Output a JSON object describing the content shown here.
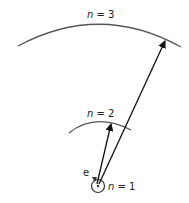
{
  "diagram": {
    "levels": [
      {
        "id": "n1",
        "label_var": "n",
        "label_eq": " = 1"
      },
      {
        "id": "n2",
        "label_var": "n",
        "label_eq": " = 2"
      },
      {
        "id": "n3",
        "label_var": "n",
        "label_eq": " = 3"
      }
    ],
    "electron_label": "e",
    "transitions": [
      {
        "from": "n1",
        "to": "n2"
      },
      {
        "from": "n1",
        "to": "n3"
      }
    ],
    "colors": {
      "arc": "#555555",
      "arrow": "#111111",
      "text": "#222222"
    }
  }
}
